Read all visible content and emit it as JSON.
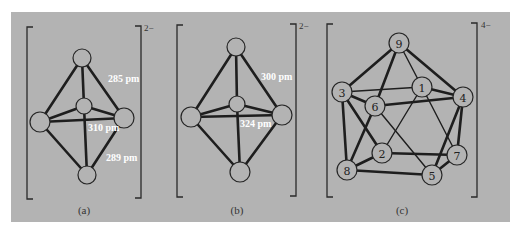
{
  "figure": {
    "panels": [
      {
        "id": "a",
        "caption": "(a)",
        "charge": "2−",
        "distance_labels": [
          "285 pm",
          "310 pm",
          "289 pm"
        ],
        "atoms": [
          "top",
          "center",
          "left",
          "right",
          "bottom"
        ]
      },
      {
        "id": "b",
        "caption": "(b)",
        "charge": "2−",
        "distance_labels": [
          "300 pm",
          "324 pm"
        ],
        "atoms": [
          "top",
          "center",
          "left",
          "right",
          "bottom"
        ]
      },
      {
        "id": "c",
        "caption": "(c)",
        "charge": "4−",
        "atoms": [
          "1",
          "2",
          "3",
          "4",
          "5",
          "6",
          "7",
          "8",
          "9"
        ]
      }
    ],
    "colors": {
      "background": "#b3b3b3",
      "lines": "#1e1e1e",
      "distance_text": "#ffffff"
    }
  }
}
